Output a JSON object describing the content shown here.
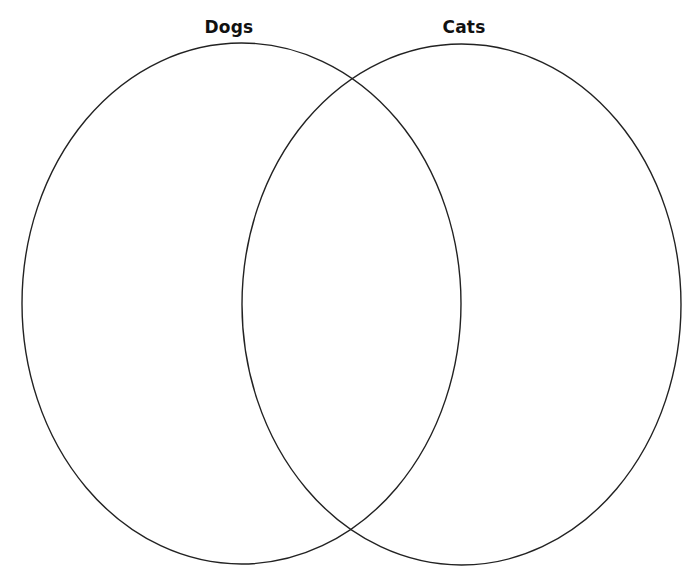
{
  "diagram": {
    "type": "venn",
    "sets": [
      {
        "id": "dogs",
        "label": "Dogs",
        "cx": 241.5,
        "cy": 303.5,
        "rx": 219.5,
        "ry": 260.5,
        "label_x": 229,
        "label_y": 17
      },
      {
        "id": "cats",
        "label": "Cats",
        "cx": 461.5,
        "cy": 304.5,
        "rx": 219.5,
        "ry": 260.5,
        "label_x": 464,
        "label_y": 17
      }
    ],
    "stroke_color": "#222222",
    "background_color": "#ffffff",
    "regions": {
      "dogs_only": "",
      "both": "",
      "cats_only": ""
    }
  }
}
